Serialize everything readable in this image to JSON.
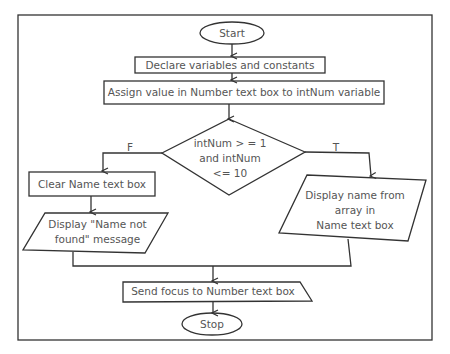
{
  "diagram": {
    "type": "flowchart",
    "nodes": {
      "start": "Start",
      "declare": "Declare variables and constants",
      "assign": "Assign value in Number text box to intNum variable",
      "decision_line1": "intNum > = 1",
      "decision_line2": "and intNum",
      "decision_line3": "<= 10",
      "clear": "Clear Name text box",
      "notfound_line1": "Display \"Name not",
      "notfound_line2": "found\" message",
      "display_line1": "Display name from",
      "display_line2": "array in",
      "display_line3": "Name text box",
      "focus": "Send focus to Number text box",
      "stop": "Stop"
    },
    "branch_labels": {
      "false": "F",
      "true": "T"
    }
  }
}
